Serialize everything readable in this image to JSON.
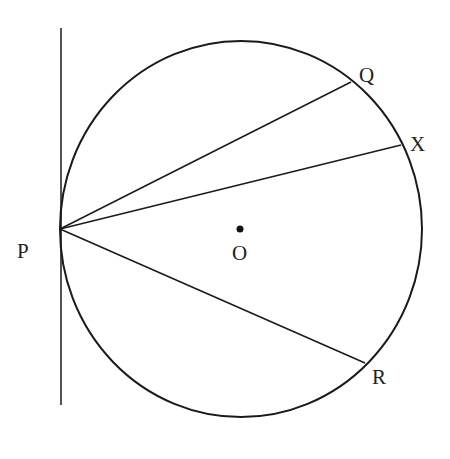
{
  "diagram": {
    "stroke_color": "#1a1a1a",
    "labels": {
      "P": "P",
      "Q": "Q",
      "X": "X",
      "R": "R",
      "O": "O"
    },
    "elements": {
      "circle": {
        "cx": 241,
        "cy": 229,
        "rx": 181,
        "ry": 188
      },
      "tangent_line": {
        "x1": 61,
        "y1": 28,
        "x2": 61,
        "y2": 405
      },
      "center_point": {
        "x": 240,
        "y": 229
      },
      "chords": [
        {
          "name": "PQ",
          "from": [
            60,
            229
          ],
          "to": [
            351,
            82
          ]
        },
        {
          "name": "PX",
          "from": [
            60,
            229
          ],
          "to": [
            401,
            145
          ]
        },
        {
          "name": "PR",
          "from": [
            60,
            229
          ],
          "to": [
            365,
            363
          ]
        }
      ]
    }
  }
}
